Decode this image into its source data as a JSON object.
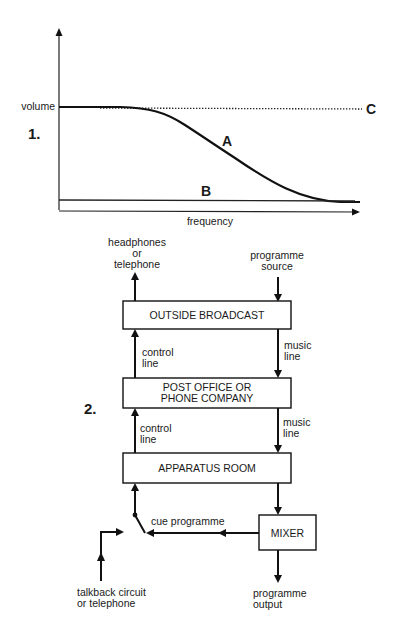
{
  "figure1": {
    "number": "1.",
    "y_axis_label": "volume",
    "x_axis_label": "frequency",
    "curves": [
      {
        "id": "A",
        "label": "A",
        "style": "solid-thick",
        "description": "volume flat then rolls off at high frequency"
      },
      {
        "id": "B",
        "label": "B",
        "style": "solid",
        "description": "low flat level across frequency"
      },
      {
        "id": "C",
        "label": "C",
        "style": "dotted",
        "description": "flat at full volume across frequency"
      }
    ]
  },
  "figure2": {
    "number": "2.",
    "boxes": {
      "outside_broadcast": "OUTSIDE BROADCAST",
      "post_office_line1": "POST OFFICE OR",
      "post_office_line2": "PHONE COMPANY",
      "apparatus_room": "APPARATUS ROOM",
      "mixer": "MIXER"
    },
    "labels": {
      "headphones_line1": "headphones",
      "headphones_line2": "or",
      "headphones_line3": "telephone",
      "programme_source_line1": "programme",
      "programme_source_line2": "source",
      "control_line1_a": "control",
      "control_line1_b": "line",
      "control_line2_a": "control",
      "control_line2_b": "line",
      "music_line1_a": "music",
      "music_line1_b": "line",
      "music_line2_a": "music",
      "music_line2_b": "line",
      "cue_programme": "cue programme",
      "talkback_line1": "talkback circuit",
      "talkback_line2": "or telephone",
      "programme_output_line1": "programme",
      "programme_output_line2": "output"
    }
  }
}
